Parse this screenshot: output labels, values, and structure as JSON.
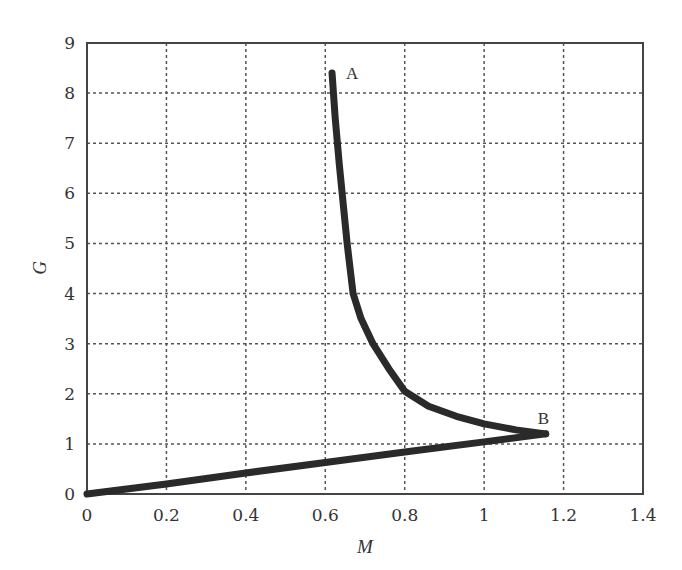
{
  "chart_data": {
    "type": "line",
    "title": "",
    "xlabel": "M",
    "ylabel": "G",
    "xlim": [
      0,
      1.4
    ],
    "ylim": [
      0,
      9
    ],
    "grid": true,
    "legend": null,
    "x_ticks": [
      "0",
      "0.2",
      "0.4",
      "0.6",
      "0.8",
      "1",
      "1.2",
      "1.4"
    ],
    "y_ticks": [
      "0",
      "1",
      "2",
      "3",
      "4",
      "5",
      "6",
      "7",
      "8",
      "9"
    ],
    "series": [
      {
        "name": "upper branch A-B",
        "x": [
          0.617,
          0.625,
          0.635,
          0.645,
          0.655,
          0.67,
          0.69,
          0.72,
          0.76,
          0.8,
          0.86,
          0.93,
          1.0,
          1.08,
          1.155
        ],
        "y": [
          8.4,
          7.5,
          6.6,
          5.8,
          5.0,
          4.0,
          3.5,
          3.0,
          2.5,
          2.05,
          1.75,
          1.55,
          1.4,
          1.28,
          1.2
        ]
      },
      {
        "name": "lower branch O-B",
        "x": [
          0,
          0.2,
          0.4,
          0.6,
          0.8,
          1.0,
          1.155
        ],
        "y": [
          0,
          0.2,
          0.42,
          0.63,
          0.84,
          1.04,
          1.2
        ]
      }
    ],
    "annotations": [
      {
        "text": "A",
        "x": 0.617,
        "y": 8.4
      },
      {
        "text": "B",
        "x": 1.155,
        "y": 1.2
      }
    ]
  },
  "labels": {
    "xlabel": "M",
    "ylabel": "G",
    "point_a": "A",
    "point_b": "B"
  }
}
